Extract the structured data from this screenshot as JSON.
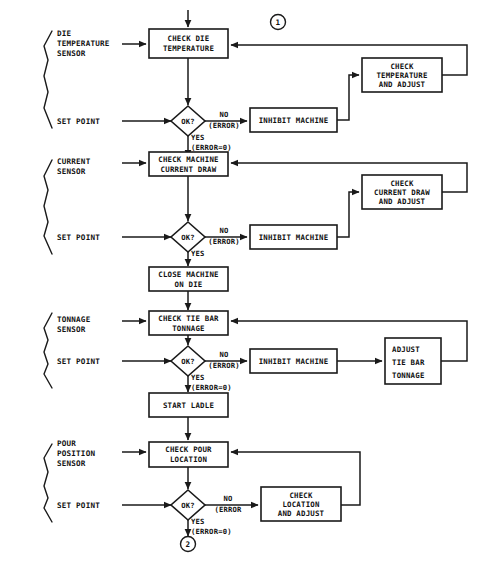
{
  "diagram": {
    "type": "flowchart",
    "colors": {
      "stroke": "#1a1a1a",
      "fill": "#ffffff",
      "background": "#ffffff",
      "text": "#111111"
    },
    "connectors": {
      "top": "1",
      "bottom": "2"
    },
    "sections": [
      {
        "id": "die-temperature",
        "sensor_label": [
          "DIE",
          "TEMPERATURE",
          "SENSOR"
        ],
        "setpoint_label": "SET POINT",
        "check_box": [
          "CHECK DIE",
          "TEMPERATURE"
        ],
        "decision": "OK?",
        "no_label": "NO",
        "no_sub": "(ERROR)",
        "yes_label": "YES",
        "yes_sub": "(ERROR=0)",
        "inhibit_box": "INHIBIT MACHINE",
        "adjust_box": [
          "CHECK",
          "TEMPERATURE",
          "AND ADJUST"
        ],
        "adjust_align": "middle"
      },
      {
        "id": "current-draw",
        "sensor_label": [
          "CURRENT",
          "SENSOR"
        ],
        "setpoint_label": "SET POINT",
        "check_box": [
          "CHECK MACHINE",
          "CURRENT DRAW"
        ],
        "decision": "OK?",
        "no_label": "NO",
        "no_sub": "(ERROR)",
        "yes_label": "YES",
        "yes_sub": "",
        "inhibit_box": "INHIBIT MACHINE",
        "adjust_box": [
          "CHECK",
          "CURRENT DRAW",
          "AND ADJUST"
        ],
        "adjust_align": "middle",
        "next_box": [
          "CLOSE MACHINE",
          "ON DIE"
        ]
      },
      {
        "id": "tie-bar-tonnage",
        "sensor_label": [
          "TONNAGE",
          "SENSOR"
        ],
        "setpoint_label": "SET POINT",
        "check_box": [
          "CHECK TIE BAR",
          "TONNAGE"
        ],
        "decision": "OK?",
        "no_label": "NO",
        "no_sub": "(ERROR)",
        "yes_label": "YES",
        "yes_sub": "(ERROR=0)",
        "inhibit_box": "INHIBIT MACHINE",
        "adjust_box": [
          "ADJUST",
          "TIE BAR",
          "TONNAGE"
        ],
        "adjust_align": "start",
        "next_box": [
          "START LADLE"
        ]
      },
      {
        "id": "pour-location",
        "sensor_label": [
          "POUR",
          "POSITION",
          "SENSOR"
        ],
        "setpoint_label": "SET POINT",
        "check_box": [
          "CHECK POUR",
          "LOCATION"
        ],
        "decision": "OK?",
        "no_label": "NO",
        "no_sub": "(ERROR",
        "yes_label": "YES",
        "yes_sub": "(ERROR=0)",
        "adjust_box": [
          "CHECK",
          "LOCATION",
          "AND ADJUST"
        ],
        "adjust_align": "middle"
      }
    ]
  }
}
